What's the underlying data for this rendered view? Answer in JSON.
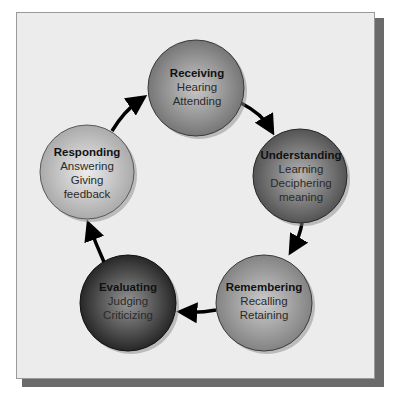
{
  "diagram": {
    "type": "cycle",
    "nodes": [
      {
        "id": "receiving",
        "title": "Receiving",
        "lines": [
          "Hearing",
          "Attending"
        ],
        "cx": 196,
        "cy": 88,
        "r": 48,
        "fill_light": "#bdbdbd",
        "fill_dark": "#6e6e6e"
      },
      {
        "id": "understanding",
        "title": "Understanding",
        "lines": [
          "Learning",
          "Deciphering",
          "meaning"
        ],
        "cx": 300,
        "cy": 176,
        "r": 47,
        "fill_light": "#a8a8a8",
        "fill_dark": "#4e4e4e"
      },
      {
        "id": "remembering",
        "title": "Remembering",
        "lines": [
          "Recalling",
          "Retaining"
        ],
        "cx": 264,
        "cy": 303,
        "r": 48,
        "fill_light": "#c2c2c2",
        "fill_dark": "#7a7a7a"
      },
      {
        "id": "evaluating",
        "title": "Evaluating",
        "lines": [
          "Judging",
          "Criticizing"
        ],
        "cx": 128,
        "cy": 303,
        "r": 48,
        "fill_light": "#8a8a8a",
        "fill_dark": "#1e1e1e"
      },
      {
        "id": "responding",
        "title": "Responding",
        "lines": [
          "Answering",
          "Giving",
          "feedback"
        ],
        "cx": 87,
        "cy": 172,
        "r": 47,
        "fill_light": "#e2e2e2",
        "fill_dark": "#a6a6a6"
      }
    ],
    "arrows": [
      {
        "from": "receiving",
        "to": "understanding"
      },
      {
        "from": "understanding",
        "to": "remembering"
      },
      {
        "from": "remembering",
        "to": "evaluating"
      },
      {
        "from": "evaluating",
        "to": "responding"
      },
      {
        "from": "responding",
        "to": "receiving"
      }
    ]
  }
}
